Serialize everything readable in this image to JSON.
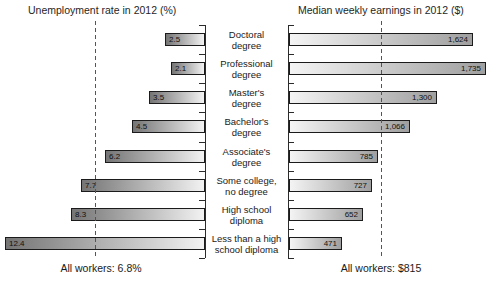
{
  "chart_data": {
    "type": "bar",
    "orientation": "horizontal",
    "layout": "bidirectional-pyramid",
    "grid": false,
    "left_title": "Unemployment rate in 2012 (%)",
    "right_title": "Median weekly earnings in 2012 ($)",
    "categories": [
      "Doctoral degree",
      "Professional degree",
      "Master's degree",
      "Bachelor's degree",
      "Associate's degree",
      "Some college, no degree",
      "High school diploma",
      "Less than a high school diploma"
    ],
    "category_lines": [
      [
        "Doctoral",
        "degree"
      ],
      [
        "Professional",
        "degree"
      ],
      [
        "Master's",
        "degree"
      ],
      [
        "Bachelor's",
        "degree"
      ],
      [
        "Associate's",
        "degree"
      ],
      [
        "Some college,",
        "no degree"
      ],
      [
        "High school",
        "diploma"
      ],
      [
        "Less than a high",
        "school diploma"
      ]
    ],
    "series": [
      {
        "name": "Unemployment rate in 2012 (%)",
        "side": "left",
        "values": [
          2.5,
          2.1,
          3.5,
          4.5,
          6.2,
          7.7,
          8.3,
          12.4
        ],
        "labels": [
          "2.5",
          "2.1",
          "3.5",
          "4.5",
          "6.2",
          "7.7",
          "8.3",
          "12.4"
        ],
        "axis_range": [
          0,
          12.4
        ],
        "reference_line": {
          "label": "All workers: 6.8%",
          "value": 6.8
        }
      },
      {
        "name": "Median weekly earnings in 2012 ($)",
        "side": "right",
        "values": [
          1624,
          1735,
          1300,
          1066,
          785,
          727,
          652,
          471
        ],
        "labels": [
          "1,624",
          "1,735",
          "1,300",
          "1,066",
          "785",
          "727",
          "652",
          "471"
        ],
        "axis_range": [
          0,
          1735
        ],
        "reference_line": {
          "label": "All workers: $815",
          "value": 815
        }
      }
    ],
    "colors": {
      "left_bar_gradient": [
        "#757575",
        "#f2f2f2"
      ],
      "right_bar_gradient": [
        "#f4f4f4",
        "#9f9f9f"
      ],
      "bar_border": "#1b1b1b",
      "axis": "#2b2b2b",
      "reference_line": "#555555",
      "text": "#1a1a1a",
      "background": "#ffffff"
    }
  }
}
